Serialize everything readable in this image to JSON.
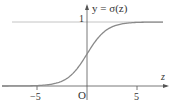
{
  "chart_data": {
    "type": "line",
    "title": "y = σ(z)",
    "xlabel": "z",
    "ylabel": "y = σ(z)",
    "function": "sigmoid: y = 1 / (1 + e^(-z))",
    "xlim": [
      -8.5,
      8
    ],
    "ylim": [
      0,
      1
    ],
    "x_ticks": [
      -5,
      0,
      5
    ],
    "x_tick_labels": [
      "−5",
      "O",
      "5"
    ],
    "y_ticks": [
      1
    ],
    "y_tick_labels": [
      "1"
    ],
    "asymptote": {
      "y": 1,
      "style": "thin line"
    },
    "series": [
      {
        "name": "σ(z)",
        "x": [
          -8,
          -6,
          -5,
          -4,
          -3,
          -2,
          -1,
          0,
          1,
          2,
          3,
          4,
          5,
          6,
          8
        ],
        "values": [
          0.0003,
          0.0025,
          0.0067,
          0.018,
          0.047,
          0.119,
          0.269,
          0.5,
          0.731,
          0.881,
          0.953,
          0.982,
          0.993,
          0.9975,
          0.9997
        ]
      }
    ],
    "grid": false,
    "legend": "none"
  },
  "labels": {
    "function": "y = σ(z)",
    "one": "1",
    "z": "z",
    "neg5": "−5",
    "origin": "O",
    "pos5": "5"
  },
  "colors": {
    "axis": "#555555",
    "curve": "#8a8a8a",
    "asymptote": "#bbbbbb",
    "text": "#333333"
  }
}
